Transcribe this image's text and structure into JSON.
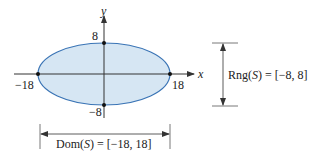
{
  "figure": {
    "axes": {
      "x_label": "x",
      "y_label": "y"
    },
    "ellipse": {
      "fill": "#d6e6f3",
      "stroke": "#3a74b5",
      "semi_major": 18,
      "semi_minor": 8
    },
    "tick_labels": {
      "top": "8",
      "bottom": "−8",
      "left": "−18",
      "right": "18"
    },
    "range_label": "Rng(S) = [−8, 8]",
    "range_prefix": "Rng(",
    "range_var": "S",
    "range_suffix": ") = [−8, 8]",
    "domain_prefix": "Dom(",
    "domain_var": "S",
    "domain_suffix": ") = [−18, 18]",
    "domain_label": "Dom(S) = [−18, 18]"
  }
}
